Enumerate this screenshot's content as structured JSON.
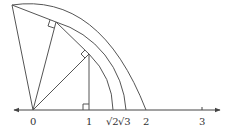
{
  "diagram": {
    "axis_labels": [
      "0",
      "1",
      "√2",
      "√3",
      "2",
      "3"
    ],
    "label_0": "0",
    "label_1": "1",
    "label_sqrt2": "√2",
    "label_sqrt3": "√3",
    "label_2": "2",
    "label_3": "3",
    "colors": {
      "line": "#555555",
      "text": "#333333",
      "background": "#ffffff"
    }
  }
}
